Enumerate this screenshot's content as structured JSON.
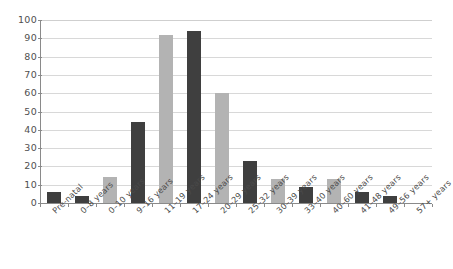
{
  "chart_data": {
    "type": "bar",
    "title": "",
    "subtitle": "",
    "xlabel": "",
    "ylabel": "",
    "ylim": [
      0,
      100
    ],
    "y_ticks": [
      0,
      10,
      20,
      30,
      40,
      50,
      60,
      70,
      80,
      90,
      100
    ],
    "grid": true,
    "legend": "none",
    "categories": [
      "Pre-natal",
      "0–8 years",
      "0–10 years",
      "9–16 years",
      "11–19 years",
      "17–24 years",
      "20–29 years",
      "25–32 years",
      "30–39 years",
      "33–40 years",
      "40–60 years",
      "41–48 years",
      "49–56 years",
      "57+ years"
    ],
    "values": [
      6,
      4,
      14,
      44,
      92,
      94,
      60,
      23,
      13,
      9,
      13,
      6,
      4,
      0
    ],
    "bar_colors": [
      "#3f3f3f",
      "#3f3f3f",
      "#b3b3b3",
      "#3f3f3f",
      "#b3b3b3",
      "#3f3f3f",
      "#b3b3b3",
      "#3f3f3f",
      "#b3b3b3",
      "#3f3f3f",
      "#b3b3b3",
      "#3f3f3f",
      "#3f3f3f",
      "#3f3f3f"
    ],
    "palette": {
      "dark": "#3f3f3f",
      "light": "#b3b3b3",
      "gridline": "#d8d8d8",
      "axis": "#8a8a8a",
      "text": "#4a4a4a",
      "background": "#ffffff"
    }
  }
}
